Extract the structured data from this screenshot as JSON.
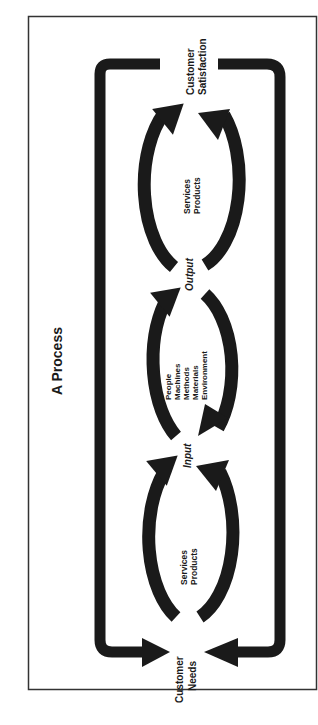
{
  "title": "A Process",
  "nodes": {
    "customer_needs": [
      "Customer",
      "Needs"
    ],
    "customer_satisfaction": [
      "Customer",
      "Satisfaction"
    ],
    "input": "Input",
    "output": "Output"
  },
  "stages": [
    {
      "name": "suppliers",
      "arc_label": "Suppliers",
      "contents": [
        "Services",
        "Products"
      ]
    },
    {
      "name": "process",
      "arc_label": "Process",
      "contents": [
        "People",
        "Machines",
        "Methods",
        "Materials",
        "Environment"
      ]
    },
    {
      "name": "customers",
      "arc_label": "Customers",
      "contents": [
        "Services",
        "Products"
      ]
    }
  ],
  "colors": {
    "ink": "#1a1a1a",
    "background": "#ffffff",
    "frame": "#333333"
  },
  "orientation": "rotated 90deg counter-clockwise"
}
